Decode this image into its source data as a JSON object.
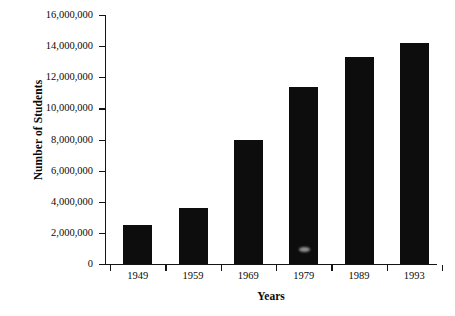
{
  "chart_data": {
    "type": "bar",
    "title": "",
    "xlabel": "Years",
    "ylabel": "Number of Students",
    "categories": [
      "1949",
      "1959",
      "1969",
      "1979",
      "1989",
      "1993"
    ],
    "values": [
      2500000,
      3600000,
      8000000,
      11400000,
      13300000,
      14200000
    ],
    "series": [
      {
        "name": "Number of Students",
        "values": [
          2500000,
          3600000,
          8000000,
          11400000,
          13300000,
          14200000
        ]
      }
    ],
    "ylim": [
      0,
      16000000
    ],
    "ytick_values": [
      0,
      2000000,
      4000000,
      6000000,
      8000000,
      10000000,
      12000000,
      14000000,
      16000000
    ],
    "ytick_labels": [
      "16,000,000",
      "14,000,000",
      "12,000,000",
      "10,000,000",
      "8,000,000",
      "6,000,000",
      "4,000,000",
      "2,000,000",
      "0"
    ],
    "grid": false,
    "legend": false,
    "legend_position": "none",
    "bar_color": "#0d0d0d",
    "axis_color": "#141414",
    "background_color": "#ffffff"
  }
}
